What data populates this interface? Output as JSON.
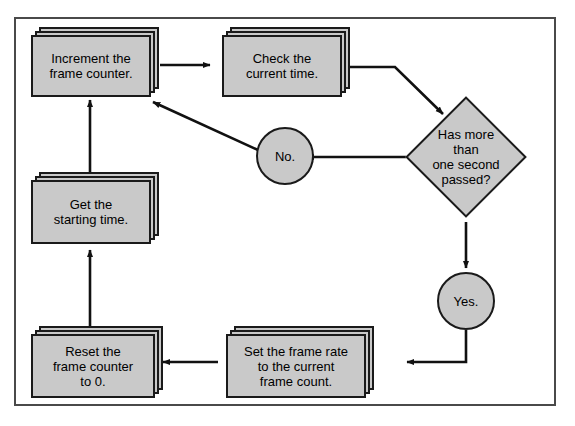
{
  "page": {
    "top_caption": "",
    "background_color": "#ffffff",
    "frame_border_color": "#4a4a4a"
  },
  "diagram": {
    "shape_fill": "#c9c9c9",
    "shape_stroke": "#1a1a1a",
    "nodes": [
      {
        "id": "increment",
        "type": "process",
        "label": "Increment the\nframe counter."
      },
      {
        "id": "check",
        "type": "process",
        "label": "Check the\ncurrent time."
      },
      {
        "id": "decision",
        "type": "decision",
        "label": "Has more\nthan\none second\npassed?"
      },
      {
        "id": "no",
        "type": "connector",
        "label": "No."
      },
      {
        "id": "yes",
        "type": "connector",
        "label": "Yes."
      },
      {
        "id": "getstart",
        "type": "process",
        "label": "Get the\nstarting time."
      },
      {
        "id": "reset",
        "type": "process",
        "label": "Reset the\nframe counter\nto 0."
      },
      {
        "id": "setrate",
        "type": "process",
        "label": "Set the frame rate\nto the current\nframe count."
      }
    ],
    "edges": [
      {
        "from": "increment",
        "to": "check",
        "style": "straight-right"
      },
      {
        "from": "check",
        "to": "decision",
        "style": "elbow-down-right"
      },
      {
        "from": "decision",
        "to": "no",
        "style": "straight-left"
      },
      {
        "from": "no",
        "to": "increment",
        "style": "diagonal-up-left"
      },
      {
        "from": "decision",
        "to": "yes",
        "style": "straight-down"
      },
      {
        "from": "yes",
        "to": "setrate",
        "style": "elbow-down-left"
      },
      {
        "from": "setrate",
        "to": "reset",
        "style": "straight-left"
      },
      {
        "from": "reset",
        "to": "getstart",
        "style": "straight-up"
      },
      {
        "from": "getstart",
        "to": "increment",
        "style": "straight-up"
      }
    ]
  }
}
